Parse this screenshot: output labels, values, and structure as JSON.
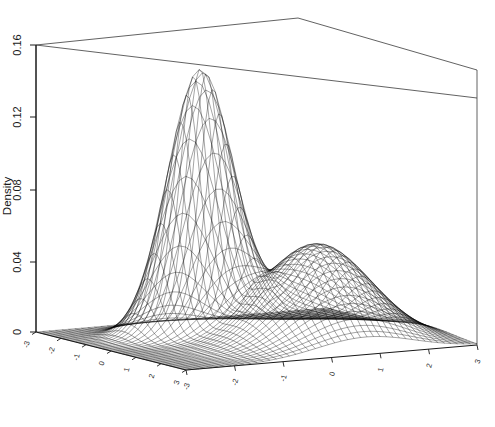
{
  "chart_data": {
    "type": "surface",
    "render": "wireframe-perspective",
    "title": "",
    "subtitle": "",
    "zlabel": "Density",
    "xlabel": "",
    "ylabel": "",
    "zlim": [
      0,
      0.16
    ],
    "z_ticks": [
      "0",
      "0.04",
      "0.08",
      "0.12",
      "0.16"
    ],
    "z_tick_values": [
      0,
      0.04,
      0.08,
      0.12,
      0.16
    ],
    "xlim": [
      -3,
      3
    ],
    "ylim": [
      -3,
      3
    ],
    "x_ticks": [
      "-3",
      "-2",
      "-1",
      "0",
      "1",
      "2",
      "3"
    ],
    "x_tick_values": [
      -3,
      -2,
      -1,
      0,
      1,
      2,
      3
    ],
    "y_ticks": [
      "-3",
      "-2",
      "-1",
      "0",
      "1",
      "2",
      "3"
    ],
    "y_tick_values": [
      -3,
      -2,
      -1,
      0,
      1,
      2,
      3
    ],
    "grid": false,
    "legend": "none",
    "box": true,
    "mesh_color": "#000000",
    "background_color": "#ffffff",
    "peaks": [
      {
        "name": "primary-peak",
        "x": -1.1,
        "y": -0.6,
        "height": 0.145
      },
      {
        "name": "secondary-peak",
        "x": 1.0,
        "y": 0.7,
        "height": 0.055
      }
    ],
    "surface_model": {
      "kind": "mixture-of-gaussians",
      "components": [
        {
          "weight": 0.62,
          "mx": -1.1,
          "my": -0.6,
          "sx": 0.55,
          "sy": 0.62,
          "amp": 0.145
        },
        {
          "weight": 0.38,
          "mx": 1.05,
          "my": 0.7,
          "sx": 1.05,
          "sy": 1.0,
          "amp": 0.055
        }
      ]
    }
  },
  "axes": {
    "z": {
      "title": "Density",
      "ticks": [
        "0.16",
        "0.12",
        "0.08",
        "0.04",
        "0"
      ]
    },
    "x_front_left": {
      "ticks": [
        "-3",
        "-2",
        "-1",
        "0",
        "1",
        "2",
        "3"
      ]
    },
    "y_front_right": {
      "ticks": [
        "-3",
        "-2",
        "-1",
        "0",
        "1",
        "2",
        "3"
      ]
    }
  },
  "colors": {
    "mesh": "#000000",
    "frame": "#3a3a3a",
    "text": "#1a1a1a",
    "background": "#ffffff"
  }
}
